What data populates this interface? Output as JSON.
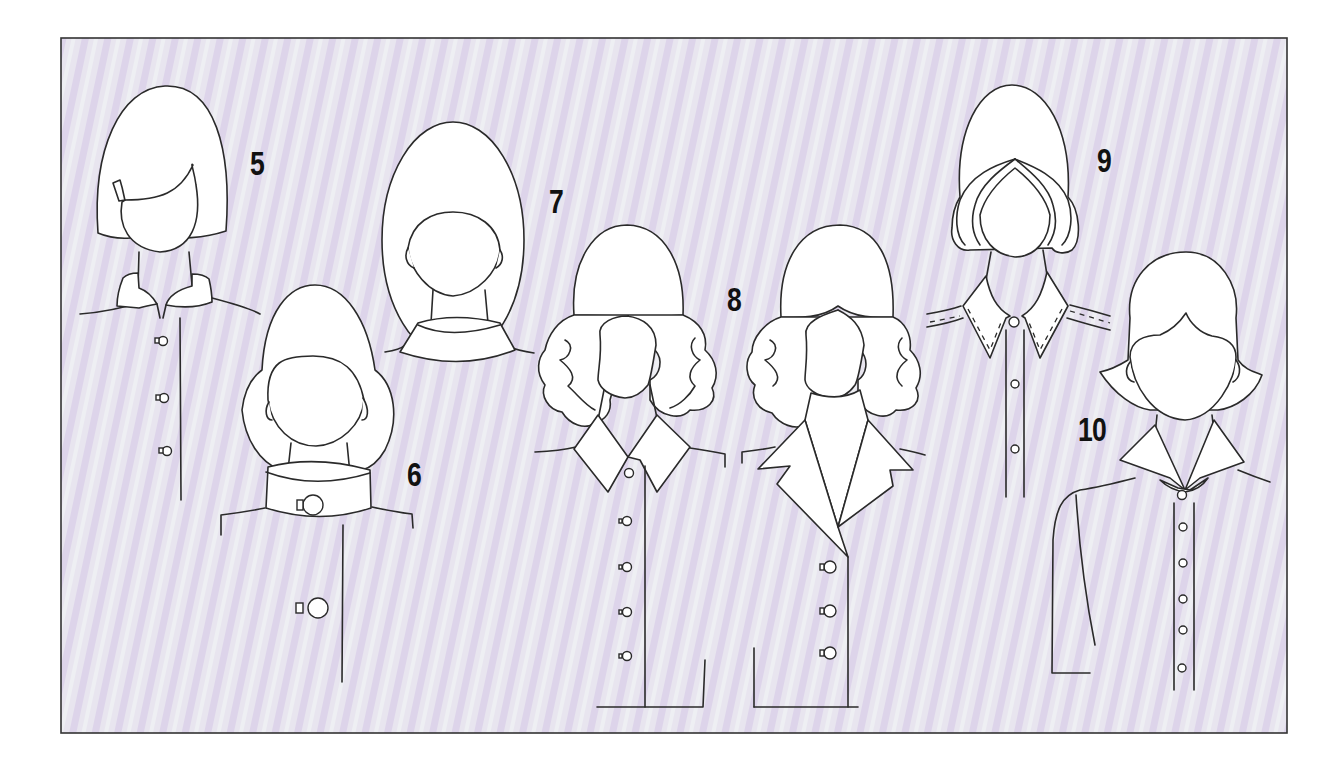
{
  "figure": {
    "background_color": "#e6e2ee",
    "stripe_color_a": "#dcd3ea",
    "stripe_color_b": "#eeeef2",
    "frame_color": "#333333",
    "ink_color": "#2a2a2a"
  },
  "labels": {
    "fig5": "5",
    "fig6": "6",
    "fig7": "7",
    "fig8": "8",
    "fig9": "9",
    "fig10": "10"
  },
  "figures": [
    {
      "id": "5",
      "hairstyle": "bob with side bangs",
      "collar": "mandarin stand collar",
      "buttons": 3
    },
    {
      "id": "6",
      "hairstyle": "rounded bouffant bob",
      "collar": "wide band collar with button",
      "buttons": 2
    },
    {
      "id": "7",
      "hairstyle": "long oval updo",
      "collar": "roll neck collar",
      "buttons": 0
    },
    {
      "id": "8a",
      "hairstyle": "curly shoulder length",
      "collar": "pointed shirt collar",
      "buttons": 5
    },
    {
      "id": "8b",
      "hairstyle": "curly shoulder length",
      "collar": "notched lapel collar",
      "buttons": 3
    },
    {
      "id": "9",
      "hairstyle": "swept-back rolled bob",
      "collar": "topstitched pointed collar",
      "buttons": 3
    },
    {
      "id": "10",
      "hairstyle": "flipped-out bob",
      "collar": "flat wing collar",
      "buttons": 6
    }
  ]
}
